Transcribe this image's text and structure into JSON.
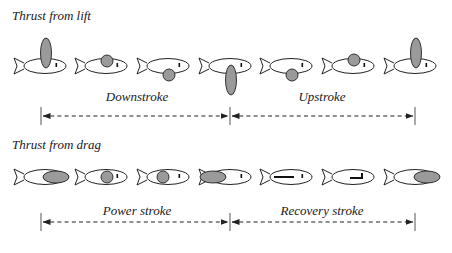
{
  "colors": {
    "stroke": "#222222",
    "fin_fill": "#9a9a9a",
    "body_fill": "#ffffff",
    "arrow": "#222222",
    "divider": "#555555"
  },
  "rows": [
    {
      "title": "Thrust from lift",
      "title_pos": {
        "x": 12,
        "y": 8
      },
      "fish_y": 66,
      "fish": [
        {
          "x": 14,
          "fin": {
            "shape": "ellipse",
            "dx": 32,
            "dy": -13,
            "rx": 5.5,
            "ry": 15
          },
          "eye": "dot"
        },
        {
          "x": 75,
          "fin": {
            "shape": "circle",
            "dx": 32,
            "dy": -5,
            "r": 6
          },
          "eye": "dot"
        },
        {
          "x": 137,
          "fin": {
            "shape": "circle",
            "dx": 32,
            "dy": 9,
            "r": 6
          },
          "eye": "dot"
        },
        {
          "x": 199,
          "fin": {
            "shape": "ellipse",
            "dx": 32,
            "dy": 14,
            "rx": 5.5,
            "ry": 15
          },
          "eye": "dot"
        },
        {
          "x": 260,
          "fin": {
            "shape": "circle",
            "dx": 32,
            "dy": 9,
            "r": 6
          },
          "eye": "dot"
        },
        {
          "x": 322,
          "fin": {
            "shape": "circle",
            "dx": 32,
            "dy": -6,
            "r": 6
          },
          "eye": "dot"
        },
        {
          "x": 384,
          "fin": {
            "shape": "ellipse",
            "dx": 32,
            "dy": -13,
            "rx": 5.5,
            "ry": 15
          },
          "eye": "dot"
        }
      ],
      "arrow": {
        "y": 116,
        "x_start": 41,
        "x_mid": 230,
        "x_end": 415
      },
      "phases": [
        {
          "label": "Downstroke",
          "cx": 137,
          "y": 89
        },
        {
          "label": "Upstroke",
          "cx": 322,
          "y": 89
        }
      ]
    },
    {
      "title": "Thrust from drag",
      "title_pos": {
        "x": 12,
        "y": 137
      },
      "fish_y": 177,
      "fish": [
        {
          "x": 14,
          "fin": {
            "shape": "ellipse",
            "dx": 42,
            "dy": 0,
            "rx": 13,
            "ry": 6
          },
          "eye": "hidden"
        },
        {
          "x": 75,
          "fin": {
            "shape": "circle",
            "dx": 32,
            "dy": 0,
            "r": 6
          },
          "eye": "dot"
        },
        {
          "x": 137,
          "fin": {
            "shape": "circle",
            "dx": 26,
            "dy": 0,
            "r": 6
          },
          "eye": "dot"
        },
        {
          "x": 199,
          "fin": {
            "shape": "ellipse",
            "dx": 14,
            "dy": 0,
            "rx": 13,
            "ry": 6
          },
          "eye": "dot"
        },
        {
          "x": 260,
          "fin": {
            "shape": "bar",
            "dx": 14,
            "dy": 0,
            "len": 20
          },
          "eye": "dot"
        },
        {
          "x": 322,
          "fin": {
            "shape": "hook",
            "dx": 28,
            "dy": 0,
            "len": 12
          },
          "eye": "hidden"
        },
        {
          "x": 384,
          "fin": {
            "shape": "ellipse",
            "dx": 43,
            "dy": 0,
            "rx": 13,
            "ry": 6
          },
          "eye": "hidden"
        }
      ],
      "arrow": {
        "y": 222,
        "x_start": 41,
        "x_mid": 230,
        "x_end": 415
      },
      "phases": [
        {
          "label": "Power stroke",
          "cx": 137,
          "y": 203
        },
        {
          "label": "Recovery stroke",
          "cx": 322,
          "y": 203
        }
      ]
    }
  ]
}
